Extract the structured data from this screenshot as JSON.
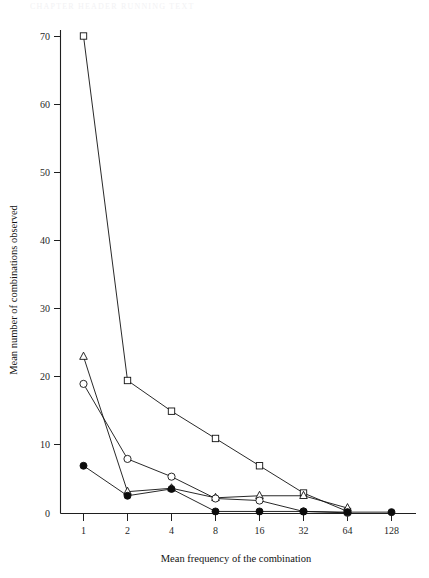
{
  "page": {
    "top_strip_text": "CHAPTER HEADER RUNNING TEXT"
  },
  "chart_data": {
    "type": "line",
    "title": "",
    "xlabel": "Mean frequency of the combination",
    "ylabel": "Mean number of combinations observed",
    "x_categories": [
      "1",
      "2",
      "4",
      "8",
      "16",
      "32",
      "64",
      "128"
    ],
    "x_scale": "log2 (categorical tick spacing)",
    "y_ticks": [
      "0",
      "10",
      "20",
      "30",
      "40",
      "50",
      "60",
      "70"
    ],
    "y_tick_values": [
      0,
      10,
      20,
      30,
      40,
      50,
      60,
      70
    ],
    "ylim": [
      0,
      72
    ],
    "grid": false,
    "legend_position": "none",
    "series": [
      {
        "name": "open-square",
        "marker": "open square",
        "x": [
          "1",
          "2",
          "4",
          "8",
          "16",
          "32",
          "64"
        ],
        "values": [
          70,
          19.5,
          15,
          11,
          7,
          3,
          0.3
        ]
      },
      {
        "name": "open-triangle",
        "marker": "open triangle",
        "x": [
          "1",
          "2",
          "4",
          "8",
          "16",
          "32",
          "64"
        ],
        "values": [
          23,
          3.2,
          3.7,
          2.3,
          2.6,
          2.6,
          0.8
        ]
      },
      {
        "name": "open-circle",
        "marker": "open circle",
        "x": [
          "1",
          "2",
          "4",
          "8",
          "16",
          "32",
          "64"
        ],
        "values": [
          19,
          8,
          5.4,
          2.2,
          1.9,
          0.3,
          0.1
        ]
      },
      {
        "name": "filled-circle",
        "marker": "filled circle",
        "x": [
          "1",
          "2",
          "4",
          "8",
          "16",
          "32",
          "64",
          "128"
        ],
        "values": [
          7,
          2.6,
          3.6,
          0.3,
          0.3,
          0.3,
          0.2,
          0.2
        ]
      }
    ]
  }
}
